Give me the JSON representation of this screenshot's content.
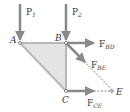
{
  "diagram": {
    "colors": {
      "arrow": "#8a8a8a",
      "member": "#b8b8b8",
      "fill": "#e4e4e4",
      "text": "#3a3a3a",
      "dashed": "#666666"
    },
    "nodes": [
      {
        "id": "A",
        "label": "A",
        "x": 20,
        "y": 43
      },
      {
        "id": "B",
        "label": "B",
        "x": 66,
        "y": 43
      },
      {
        "id": "C",
        "label": "C",
        "x": 66,
        "y": 91
      },
      {
        "id": "E",
        "label": "E",
        "x": 113,
        "y": 91
      }
    ],
    "loads": [
      {
        "id": "P1",
        "label_main": "P",
        "label_sub": "1",
        "at": "A",
        "direction": "down"
      },
      {
        "id": "P2",
        "label_main": "P",
        "label_sub": "2",
        "at": "B",
        "direction": "down"
      }
    ],
    "member_forces": [
      {
        "id": "F_BD",
        "label_main": "F",
        "label_sub": "BD",
        "from": "B",
        "direction": "right"
      },
      {
        "id": "F_BE",
        "label_main": "F",
        "label_sub": "BE",
        "from": "B",
        "direction": "toward E"
      },
      {
        "id": "F_CE",
        "label_main": "F",
        "label_sub": "CE",
        "from": "C",
        "direction": "right"
      }
    ]
  }
}
